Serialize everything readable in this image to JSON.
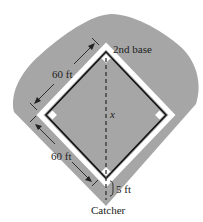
{
  "diagram": {
    "labels": {
      "second_base": "2nd base",
      "side_top": "60 ft",
      "side_bottom": "60 ft",
      "distance_var": "x",
      "catcher_offset": "5 ft",
      "catcher": "Catcher"
    },
    "colors": {
      "field": "#a6a6a6",
      "lines": "#111111",
      "chalk": "#ffffff",
      "background": "#ffffff"
    }
  }
}
